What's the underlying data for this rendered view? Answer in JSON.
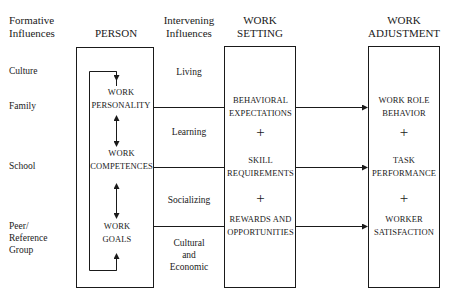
{
  "headers": {
    "formative": [
      "Formative",
      "Influences"
    ],
    "person": "PERSON",
    "intervening": [
      "Intervening",
      "Influences"
    ],
    "work_setting": [
      "WORK",
      "SETTING"
    ],
    "work_adjustment": [
      "WORK",
      "ADJUSTMENT"
    ]
  },
  "formative_influences": [
    {
      "label": [
        "Culture"
      ]
    },
    {
      "label": [
        "Family"
      ]
    },
    {
      "label": [
        "School"
      ]
    },
    {
      "label": [
        "Peer/",
        "Reference",
        "Group"
      ]
    }
  ],
  "person_items": [
    {
      "label": [
        "WORK",
        "PERSONALITY"
      ]
    },
    {
      "label": [
        "WORK",
        "COMPETENCES"
      ]
    },
    {
      "label": [
        "WORK",
        "GOALS"
      ]
    }
  ],
  "intervening_influences": [
    {
      "label": [
        "Living"
      ]
    },
    {
      "label": [
        "Learning"
      ]
    },
    {
      "label": [
        "Socializing"
      ]
    },
    {
      "label": [
        "Cultural",
        "and",
        "Economic"
      ]
    }
  ],
  "work_setting_items": [
    {
      "label": [
        "BEHAVIORAL",
        "EXPECTATIONS"
      ]
    },
    {
      "label": [
        "SKILL",
        "REQUIREMENTS"
      ]
    },
    {
      "label": [
        "REWARDS AND",
        "OPPORTUNITIES"
      ]
    }
  ],
  "work_adjustment_items": [
    {
      "label": [
        "WORK ROLE",
        "BEHAVIOR"
      ]
    },
    {
      "label": [
        "TASK",
        "PERFORMANCE"
      ]
    },
    {
      "label": [
        "WORKER",
        "SATISFACTION"
      ]
    }
  ],
  "plus_symbol": "+",
  "colors": {
    "line": "#1a1a1a",
    "background": "#ffffff"
  }
}
